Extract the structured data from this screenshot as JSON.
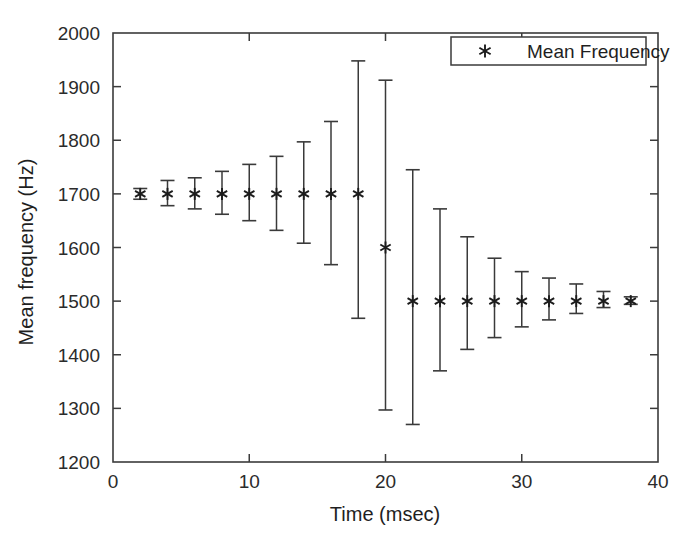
{
  "chart_data": {
    "type": "scatter",
    "title": "",
    "xlabel": "Time (msec)",
    "ylabel": "Mean frequency (Hz)",
    "xlim": [
      0,
      40
    ],
    "ylim": [
      1200,
      2000
    ],
    "xticks": [
      0,
      10,
      20,
      30,
      40
    ],
    "xticklabels": [
      "0",
      "10",
      "20",
      "30",
      "40"
    ],
    "xminorticks": [
      5,
      15,
      25,
      35
    ],
    "yticks": [
      1200,
      1300,
      1400,
      1500,
      1600,
      1700,
      1800,
      1900,
      2000
    ],
    "yticklabels": [
      "1200",
      "1300",
      "1400",
      "1500",
      "1600",
      "1700",
      "1800",
      "1900",
      "2000"
    ],
    "grid": false,
    "legend_position": "top-right",
    "series": [
      {
        "name": "Mean Frequency",
        "marker": "asterisk",
        "color": "#2b2b2b",
        "x": [
          2,
          4,
          6,
          8,
          10,
          12,
          14,
          16,
          18,
          20,
          22,
          24,
          26,
          28,
          30,
          32,
          34,
          36,
          38
        ],
        "y": [
          1700,
          1700,
          1700,
          1700,
          1700,
          1700,
          1700,
          1700,
          1700,
          1600,
          1500,
          1500,
          1500,
          1500,
          1500,
          1500,
          1500,
          1500,
          1500
        ],
        "y_upper": [
          1710,
          1725,
          1730,
          1742,
          1755,
          1770,
          1797,
          1835,
          1948,
          1912,
          1745,
          1672,
          1620,
          1580,
          1555,
          1543,
          1532,
          1518,
          1508
        ],
        "y_lower": [
          1690,
          1678,
          1672,
          1662,
          1650,
          1632,
          1608,
          1568,
          1468,
          1297,
          1270,
          1370,
          1410,
          1432,
          1452,
          1465,
          1477,
          1488,
          1494
        ]
      }
    ]
  },
  "legend": {
    "entries": [
      {
        "label": "Mean Frequency",
        "marker": "asterisk-marker"
      }
    ]
  },
  "axes": {
    "x_axis_name": "time-axis",
    "y_axis_name": "frequency-axis"
  }
}
